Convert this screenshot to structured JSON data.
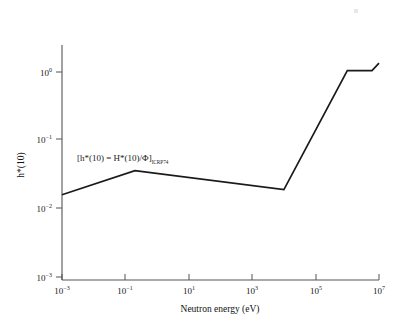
{
  "chart_data": {
    "type": "line",
    "title": "",
    "xlabel": "Neutron energy (eV)",
    "ylabel": "h*(10)",
    "xscale": "log",
    "yscale": "log",
    "xlim": [
      0.001,
      10000000
    ],
    "ylim": [
      0.001,
      3
    ],
    "grid": false,
    "legend": null,
    "annotations": [
      {
        "text_main": "[h*(10) = H*(10)/Φ]",
        "text_sub": "ICRP74",
        "x": 0.02,
        "y": 0.062
      }
    ],
    "xticks": [
      {
        "value": 0.001,
        "mantissa": "10",
        "exponent": "−3"
      },
      {
        "value": 0.1,
        "mantissa": "10",
        "exponent": "−1"
      },
      {
        "value": 10,
        "mantissa": "10",
        "exponent": "1"
      },
      {
        "value": 1000,
        "mantissa": "10",
        "exponent": "3"
      },
      {
        "value": 100000,
        "mantissa": "10",
        "exponent": "5"
      },
      {
        "value": 10000000,
        "mantissa": "10",
        "exponent": "7"
      }
    ],
    "yticks": [
      {
        "value": 1,
        "mantissa": "10",
        "exponent": "0"
      },
      {
        "value": 0.1,
        "mantissa": "10",
        "exponent": "−1"
      },
      {
        "value": 0.01,
        "mantissa": "10",
        "exponent": "−2"
      },
      {
        "value": 0.001,
        "mantissa": "10",
        "exponent": "−3"
      }
    ],
    "series": [
      {
        "name": "h*(10) fluence-to-dose conversion coefficient",
        "color": "#1a1a1a",
        "x": [
          0.001,
          0.2,
          10000,
          1000000,
          6000000,
          10000000
        ],
        "y": [
          0.016,
          0.036,
          0.019,
          1.05,
          1.05,
          1.35
        ]
      }
    ]
  },
  "axis": {
    "x_title": "Neutron energy (eV)",
    "y_title": "h*(10)"
  },
  "colors": {
    "line": "#1a1a1a",
    "axis": "#555555",
    "text": "#1a1a1a",
    "background": "#ffffff"
  }
}
